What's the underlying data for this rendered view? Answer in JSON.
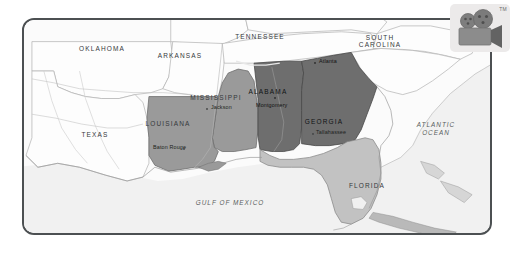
{
  "document": {
    "type": "map-image",
    "title": "Southeastern United States regional map"
  },
  "logo": {
    "name": "movie-camera-logo",
    "trademark": "TM",
    "background": "#eceaea",
    "body_color": "#8c8c8c",
    "reel_color": "#7b7b7b",
    "accent_color": "#636363"
  },
  "map": {
    "frame": {
      "border_color": "#4c5052",
      "corner_radius": "12px",
      "background": "#f3f3f3"
    },
    "legend_colors": {
      "highlight_dark": "#6e6e6e",
      "highlight_medium": "#9a9a9a",
      "highlight_light": "#c2c2c2",
      "unhighlighted_land": "#fbfbfb",
      "water": "#f0f0f0",
      "border_line": "#9d9d9d"
    },
    "states": [
      {
        "name": "OKLAHOMA",
        "shade": "unhighlighted",
        "x": 100,
        "y": 43
      },
      {
        "name": "ARKANSAS",
        "shade": "unhighlighted",
        "x": 178,
        "y": 50
      },
      {
        "name": "TENNESSEE",
        "shade": "unhighlighted",
        "x": 258,
        "y": 31
      },
      {
        "name": "SOUTH CAROLINA",
        "shade": "unhighlighted",
        "x": 378,
        "y": 36
      },
      {
        "name": "TEXAS",
        "shade": "unhighlighted",
        "x": 93,
        "y": 129
      },
      {
        "name": "MISSISSIPPI",
        "shade": "medium",
        "x": 214,
        "y": 92
      },
      {
        "name": "LOUISIANA",
        "shade": "medium",
        "x": 166,
        "y": 118
      },
      {
        "name": "ALABAMA",
        "shade": "dark",
        "x": 266,
        "y": 86
      },
      {
        "name": "GEORGIA",
        "shade": "dark",
        "x": 322,
        "y": 116
      },
      {
        "name": "FLORIDA",
        "shade": "light",
        "x": 365,
        "y": 180
      }
    ],
    "state_label_rows": {
      "SOUTH CAROLINA": [
        "SOUTH",
        "CAROLINA"
      ]
    },
    "cities": [
      {
        "name": "Jackson",
        "x": 207,
        "y": 105,
        "dot": "left",
        "state": "MISSISSIPPI"
      },
      {
        "name": "Baton Rouge",
        "x": 175,
        "y": 145,
        "dot": "right",
        "state": "LOUISIANA"
      },
      {
        "name": "Montgomery",
        "x": 272,
        "y": 101,
        "dot": "above",
        "state": "ALABAMA"
      },
      {
        "name": "Atlanta",
        "x": 318,
        "y": 60,
        "dot": "left",
        "state": "GEORGIA"
      },
      {
        "name": "Tallahassee",
        "x": 320,
        "y": 130,
        "dot": "left",
        "state": "FLORIDA"
      }
    ],
    "water_bodies": [
      {
        "name": "GULF OF MEXICO",
        "x": 228,
        "y": 201
      },
      {
        "name": "ATLANTIC OCEAN",
        "x": 434,
        "y": 127,
        "lines": [
          "ATLANTIC",
          "OCEAN"
        ]
      }
    ]
  }
}
